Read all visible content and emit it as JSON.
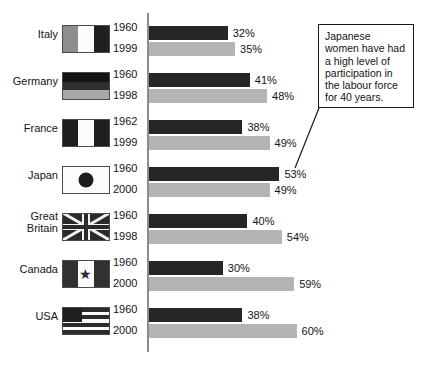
{
  "chart_data": {
    "type": "bar",
    "title": "",
    "xlabel": "",
    "ylabel": "",
    "orientation": "horizontal",
    "unit": "%",
    "xlim": [
      0,
      65
    ],
    "grid": false,
    "legend": "none",
    "axis_baseline_value": 0,
    "categories": [
      "Italy",
      "Germany",
      "France",
      "Japan",
      "Great Britain",
      "Canada",
      "USA"
    ],
    "series": [
      {
        "name": "earlier year",
        "color": "#262626",
        "years": [
          "1960",
          "1960",
          "1962",
          "1960",
          "1960",
          "1960",
          "1960"
        ],
        "values": [
          32,
          41,
          38,
          53,
          40,
          30,
          38
        ],
        "labels": [
          "32%",
          "41%",
          "38%",
          "53%",
          "40%",
          "30%",
          "38%"
        ]
      },
      {
        "name": "later year",
        "color": "#b4b4b4",
        "years": [
          "1999",
          "1998",
          "1999",
          "2000",
          "1998",
          "2000",
          "2000"
        ],
        "values": [
          35,
          48,
          49,
          49,
          54,
          59,
          60
        ],
        "labels": [
          "35%",
          "48%",
          "49%",
          "49%",
          "54%",
          "59%",
          "60%"
        ]
      }
    ],
    "annotations": [
      {
        "text": "Japanese women have had a high level of participation in the labour force for 40 years.",
        "points_to": "Japan"
      }
    ]
  },
  "rows": [
    {
      "country": "Italy",
      "country_lines": [
        "Italy"
      ],
      "flag": "flag-italy",
      "year_early": "1960",
      "year_late": "1999",
      "value_early": 32,
      "value_late": 35,
      "label_early": "32%",
      "label_late": "35%"
    },
    {
      "country": "Germany",
      "country_lines": [
        "Germany"
      ],
      "flag": "flag-germany",
      "year_early": "1960",
      "year_late": "1998",
      "value_early": 41,
      "value_late": 48,
      "label_early": "41%",
      "label_late": "48%"
    },
    {
      "country": "France",
      "country_lines": [
        "France"
      ],
      "flag": "flag-france",
      "year_early": "1962",
      "year_late": "1999",
      "value_early": 38,
      "value_late": 49,
      "label_early": "38%",
      "label_late": "49%"
    },
    {
      "country": "Japan",
      "country_lines": [
        "Japan"
      ],
      "flag": "flag-japan",
      "year_early": "1960",
      "year_late": "2000",
      "value_early": 53,
      "value_late": 49,
      "label_early": "53%",
      "label_late": "49%"
    },
    {
      "country": "Great Britain",
      "country_lines": [
        "Great",
        "Britain"
      ],
      "flag": "flag-great-britain",
      "year_early": "1960",
      "year_late": "1998",
      "value_early": 40,
      "value_late": 54,
      "label_early": "40%",
      "label_late": "54%"
    },
    {
      "country": "Canada",
      "country_lines": [
        "Canada"
      ],
      "flag": "flag-canada",
      "year_early": "1960",
      "year_late": "2000",
      "value_early": 30,
      "value_late": 59,
      "label_early": "30%",
      "label_late": "59%"
    },
    {
      "country": "USA",
      "country_lines": [
        "USA"
      ],
      "flag": "flag-usa",
      "year_early": "1960",
      "year_late": "2000",
      "value_early": 38,
      "value_late": 60,
      "label_early": "38%",
      "label_late": "60%"
    }
  ],
  "annotation": {
    "text": "Japanese women have had a high level of participation in the labour force for 40 years."
  },
  "colors": {
    "bar_early": "#262626",
    "bar_late": "#b4b4b4",
    "axis": "#8c8c8c",
    "text": "#141414",
    "box_border": "#1a1a1a",
    "background": "#ffffff"
  }
}
